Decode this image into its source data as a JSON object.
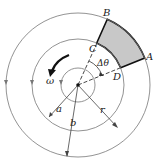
{
  "diagram": {
    "colors": {
      "line": "#666666",
      "bold_line": "#111111",
      "shade": "#c8c8c8",
      "background": "#ffffff"
    },
    "points": {
      "A": "A",
      "B": "B",
      "C": "C",
      "D": "D"
    },
    "labels": {
      "delta_theta": "Δθ",
      "omega": "ω",
      "a": "a",
      "b": "b",
      "r": "r"
    },
    "circles": [
      "inner",
      "middle (radius a)",
      "outer (radius b)"
    ],
    "sector_angle_deg": {
      "start": 22,
      "end": 66
    }
  }
}
